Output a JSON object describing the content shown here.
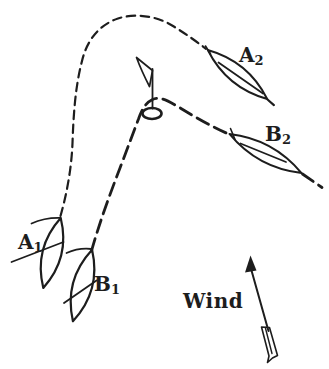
{
  "diagram": {
    "ink_color": "#1d1d1d",
    "paper_color": "#ffffff",
    "labels": {
      "boat_a1": {
        "main": "A",
        "sub": "1"
      },
      "boat_b1": {
        "main": "B",
        "sub": "1"
      },
      "boat_a2": {
        "main": "A",
        "sub": "2"
      },
      "boat_b2": {
        "main": "B",
        "sub": "2"
      },
      "wind": "Wind"
    }
  }
}
